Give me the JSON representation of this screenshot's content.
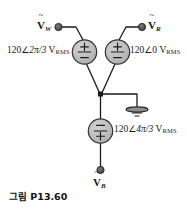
{
  "figure": {
    "caption": "그림 P13.60",
    "type": "three-phase-wye-source-circuit",
    "line_color": "#1a1a1a",
    "source_fill": "#b8b8b8",
    "source_stroke": "#333333",
    "terminal_fill": "#4d4d4d",
    "background": "#ffffff"
  },
  "terminals": [
    {
      "id": "w",
      "symbol": "V",
      "accent": "~",
      "subscript": "W",
      "position": "top-left"
    },
    {
      "id": "r",
      "symbol": "V",
      "accent": "~",
      "subscript": "R",
      "position": "top-right"
    },
    {
      "id": "b",
      "symbol": "V",
      "accent": "~",
      "subscript": "B",
      "position": "bottom"
    }
  ],
  "sources": [
    {
      "id": "source-w",
      "magnitude": "120",
      "angle_symbol": "∠",
      "angle": "2π/3",
      "unit": "V",
      "unit_subscript": "RMS",
      "full_label": "120∠2π/3 V RMS",
      "plus_position": "top",
      "minus_position": "bottom",
      "phase": "W"
    },
    {
      "id": "source-r",
      "magnitude": "120",
      "angle_symbol": "∠",
      "angle": "0",
      "unit": "V",
      "unit_subscript": "RMS",
      "full_label": "120∠0 V RMS",
      "plus_position": "top",
      "minus_position": "bottom",
      "phase": "R"
    },
    {
      "id": "source-b",
      "magnitude": "120",
      "angle_symbol": "∠",
      "angle": "4π/3",
      "unit": "V",
      "unit_subscript": "RMS",
      "full_label": "120∠4π/3 V RMS",
      "plus_position": "bottom",
      "minus_position": "top",
      "phase": "B"
    }
  ],
  "ground": {
    "label": "",
    "name": "earth-ground"
  }
}
